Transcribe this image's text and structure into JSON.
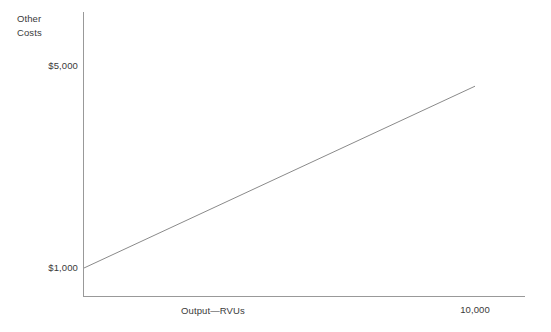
{
  "chart_data": {
    "type": "line",
    "title": "",
    "xlabel": "Output—RVUs",
    "ylabel": "Other\nCosts",
    "x": [
      0,
      10000
    ],
    "values": [
      1000,
      4600
    ],
    "series": [
      {
        "name": "Other Costs",
        "x": [
          0,
          10000
        ],
        "values": [
          1000,
          4600
        ]
      }
    ],
    "ytick_labels": [
      "$5,000",
      "$1,000"
    ],
    "ytick_values": [
      5000,
      1000
    ],
    "xtick_labels": [
      "10,000"
    ],
    "xtick_values": [
      10000
    ],
    "xlim": [
      0,
      11000
    ],
    "ylim": [
      0,
      5600
    ],
    "grid": false,
    "legend": false,
    "line_color": "#8a8a8a",
    "axis_color": "#999999",
    "text_color": "#3a3a3a",
    "background": "#ffffff"
  },
  "axes": {
    "y_title": "Other\nCosts",
    "x_title": "Output—RVUs",
    "y_label_high": "$5,000",
    "y_label_low": "$1,000",
    "x_label_max": "10,000"
  }
}
